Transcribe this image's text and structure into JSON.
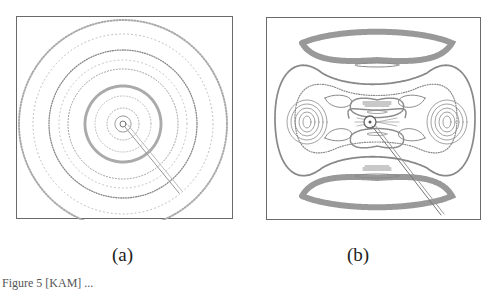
{
  "figure": {
    "panels": [
      {
        "id": "a",
        "label": "(a)",
        "description": "Concentric dotted invariant circles around central point with radial line to lower-right"
      },
      {
        "id": "b",
        "label": "(b)",
        "description": "Phase portrait with island chains, elliptic regions left/right, chaotic bands top/bottom, radial line to lower-right"
      }
    ],
    "caption": "Figure 5 [KAM] ..."
  },
  "colors": {
    "ink": "#8a8a8a",
    "frame": "#6a6a6a"
  }
}
